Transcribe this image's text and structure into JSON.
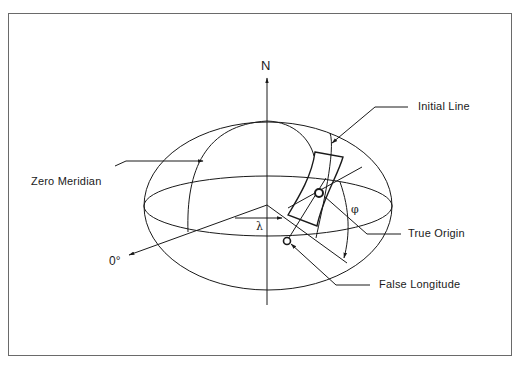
{
  "diagram": {
    "type": "ellipsoid-projection-diagram",
    "axis": {
      "north_label": "N"
    },
    "labels": {
      "initial_line": "Initial Line",
      "zero_meridian": "Zero Meridian",
      "true_origin": "True Origin",
      "false_longitude": "False Longitude",
      "zero_degrees": "0°"
    },
    "symbols": {
      "longitude": "λ",
      "latitude": "φ"
    },
    "colors": {
      "line": "#1a1a1a",
      "frame": "#6a6a6a",
      "background": "#ffffff"
    }
  }
}
